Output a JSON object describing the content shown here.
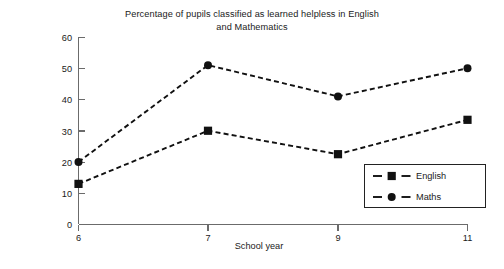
{
  "chart_data": {
    "type": "line",
    "title": "Percentage of pupils classified as learned helpless in English and Mathematics",
    "title_line1": "Percentage of pupils classified as learned helpless in English",
    "title_line2": "and Mathematics",
    "xlabel": "School year",
    "ylabel": "Percentage classified as learned\nhelpless",
    "ylabel_line1": "Percentage classified as learned",
    "ylabel_line2": "helpless",
    "categories": [
      "6",
      "7",
      "9",
      "11"
    ],
    "x_tick_labels": [
      "6",
      "7",
      "9",
      "11"
    ],
    "y_tick_labels": [
      "0",
      "10",
      "20",
      "30",
      "40",
      "50",
      "60"
    ],
    "y_ticks": [
      0,
      10,
      20,
      30,
      40,
      50,
      60
    ],
    "ylim": [
      0,
      60
    ],
    "grid": false,
    "legend_position": "bottom-right",
    "series": [
      {
        "name": "English",
        "marker": "square",
        "linestyle": "dashed",
        "color": "#111111",
        "values": [
          13,
          30,
          22.5,
          33.5
        ]
      },
      {
        "name": "Maths",
        "marker": "circle",
        "linestyle": "dashed",
        "color": "#111111",
        "values": [
          20,
          51,
          41,
          50
        ]
      }
    ]
  },
  "legend": {
    "items": [
      {
        "label": "English",
        "marker": "square"
      },
      {
        "label": "Maths",
        "marker": "circle"
      }
    ]
  },
  "colors": {
    "axis": "#6b6b6b",
    "series": "#111111",
    "text": "#1a1a1a",
    "background": "#ffffff"
  }
}
